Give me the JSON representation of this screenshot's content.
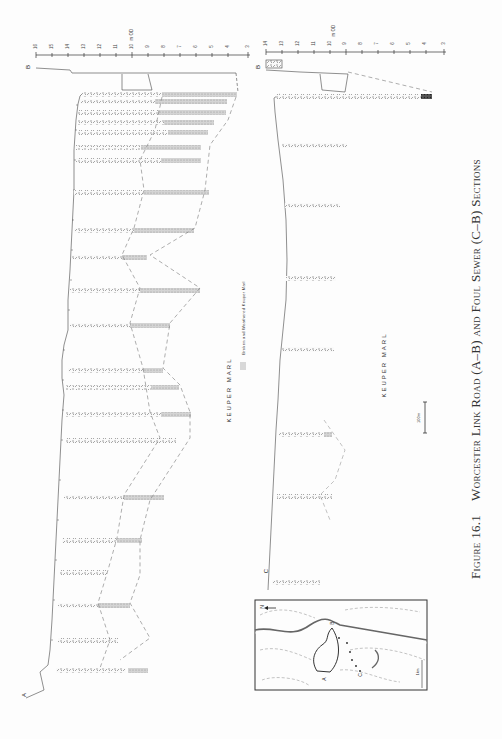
{
  "figure": {
    "number": "Figure 16.1",
    "title": "Worcester Link Road (A–B) and Foul Sewer (C–B) Sections"
  },
  "section_labels": {
    "upper_geology": "KEUPER   MARL",
    "lower_geology": "KEUPER   MARL",
    "legend_text": "Broken and Weathered Keuper Marl",
    "point_A": "A",
    "point_B_upper": "B",
    "point_B_lower": "B",
    "point_C": "C"
  },
  "scale_bar": {
    "label": "100m"
  },
  "upper_axis": {
    "unit_label": "m OD",
    "ticks": [
      "16",
      "15",
      "14",
      "13",
      "12",
      "11",
      "10",
      "9",
      "8",
      "7",
      "6",
      "5",
      "4",
      "3"
    ]
  },
  "lower_axis": {
    "unit_label": "m OD",
    "ticks": [
      "14",
      "13",
      "12",
      "11",
      "10",
      "9",
      "8",
      "7",
      "6",
      "5",
      "4",
      "3"
    ]
  },
  "inset_map": {
    "north_label": "N",
    "labels": [
      "A",
      "B",
      "C"
    ],
    "scale_label": "1km"
  }
}
